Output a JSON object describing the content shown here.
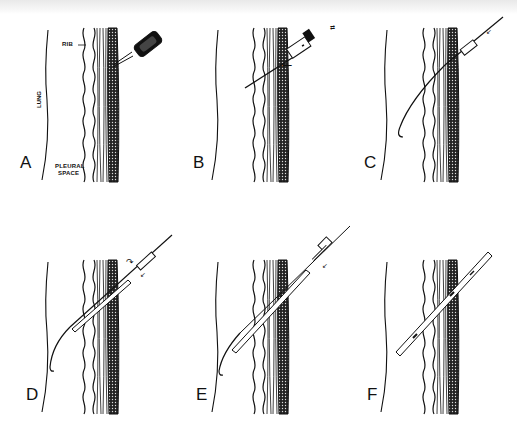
{
  "figure": {
    "type": "multi-panel medical illustration",
    "panels": [
      {
        "id": "A",
        "label": "A",
        "step": "local anesthetic needle/syringe at rib",
        "annotations": [
          "RIB",
          "LUNG",
          "PLEURAL\nSPACE"
        ]
      },
      {
        "id": "B",
        "label": "B",
        "step": "needle with syringe advanced into pleural space (aspiration)"
      },
      {
        "id": "C",
        "label": "C",
        "step": "J-tip guidewire passed through needle"
      },
      {
        "id": "D",
        "label": "D",
        "step": "dilator advanced over guidewire with twisting motion"
      },
      {
        "id": "E",
        "label": "E",
        "step": "catheter advanced over guidewire"
      },
      {
        "id": "F",
        "label": "F",
        "step": "catheter left in place, guidewire removed"
      }
    ],
    "annotations": {
      "rib": "RIB",
      "lung": "LUNG",
      "pleural_space_line1": "PLEURAL",
      "pleural_space_line2": "SPACE"
    },
    "colors": {
      "ink": "#111111",
      "background": "#ffffff"
    }
  }
}
